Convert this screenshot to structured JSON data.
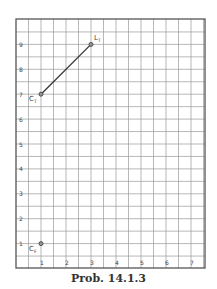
{
  "chart_data": {
    "type": "line",
    "title": "",
    "caption": "Prob. 14.1.3",
    "xlabel": "",
    "ylabel": "",
    "xlim": [
      0,
      7.5
    ],
    "ylim": [
      0,
      10
    ],
    "grid": true,
    "grid_step": 0.5,
    "xticks": [
      "1",
      "2",
      "3",
      "4",
      "5",
      "6",
      "7"
    ],
    "yticks": [
      "1",
      "2",
      "3",
      "4",
      "5",
      "6",
      "7",
      "8",
      "9"
    ],
    "points": [
      {
        "label": "C",
        "subscript": "F",
        "x": 1,
        "y": 1
      },
      {
        "label": "C",
        "subscript": "T",
        "x": 1,
        "y": 7
      },
      {
        "label": "L",
        "subscript": "T",
        "x": 3,
        "y": 9
      }
    ],
    "segments": [
      {
        "from": "C_T",
        "to": "L_T",
        "x": [
          1,
          3
        ],
        "y": [
          7,
          9
        ]
      }
    ]
  },
  "caption": "Prob. 14.1.3",
  "colors": {
    "grid": "#9a9a9a",
    "frame": "#555555",
    "line": "#333333",
    "text": "#444444"
  }
}
